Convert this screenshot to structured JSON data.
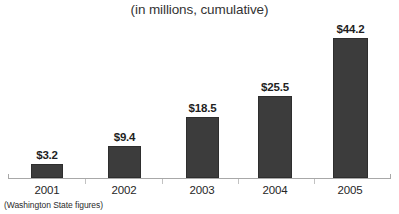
{
  "chart_data": {
    "type": "bar",
    "title": "(in millions, cumulative)",
    "xlabel": "",
    "ylabel": "",
    "categories": [
      "2001",
      "2002",
      "2003",
      "2004",
      "2005"
    ],
    "values": [
      3.2,
      9.4,
      18.5,
      25.5,
      44.2
    ],
    "data_labels": [
      "$3.2",
      "$9.4",
      "$18.5",
      "$25.5",
      "$44.2"
    ],
    "ylim": [
      0,
      48
    ],
    "grid": false,
    "legend": false,
    "footnote": "(Washington State figures)",
    "colors": {
      "bar_fill": "#3c3c3c",
      "bar_border": "#2e2e2e",
      "axis_line": "#a8a8a8",
      "tick": "#c2c2c2",
      "title_text": "#333333",
      "label_text": "#1f1f1f",
      "background": "#ffffff"
    }
  },
  "bars": [
    {
      "label": "2001",
      "value_label": "$3.2",
      "left": 31,
      "width": 32,
      "height": 14,
      "label_top": 124,
      "cat_left": 22,
      "cat_width": 50
    },
    {
      "label": "2002",
      "value_label": "$9.4",
      "left": 108,
      "width": 33,
      "height": 32,
      "label_top": 106,
      "cat_left": 99,
      "cat_width": 50
    },
    {
      "label": "2003",
      "value_label": "$18.5",
      "left": 186,
      "width": 33,
      "height": 61,
      "label_top": 77,
      "cat_left": 177,
      "cat_width": 50
    },
    {
      "label": "2004",
      "value_label": "$25.5",
      "left": 258,
      "width": 34,
      "height": 82,
      "label_top": 56,
      "cat_left": 250,
      "cat_width": 50
    },
    {
      "label": "2005",
      "value_label": "$44.2",
      "left": 333,
      "width": 35,
      "height": 140,
      "label_top": 0,
      "cat_left": 325,
      "cat_width": 50
    }
  ],
  "ticks": [
    85,
    162,
    238,
    314
  ]
}
